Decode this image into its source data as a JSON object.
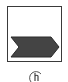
{
  "tile": {
    "label": "Chevron shape",
    "icon": "chevron-shape-icon",
    "border_color": "#3a3a3a",
    "fill_color": "#444444"
  },
  "cursor": {
    "icon": "hand-cursor-icon"
  }
}
